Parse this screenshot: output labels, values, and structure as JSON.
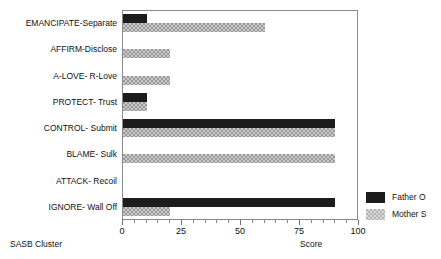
{
  "chart_data": {
    "type": "bar",
    "orientation": "horizontal",
    "title": "",
    "xlabel": "Score",
    "ylabel": "SASB Cluster",
    "xlim": [
      0,
      100
    ],
    "grid": false,
    "legend_position": "right",
    "xticks": [
      0,
      25,
      50,
      75,
      100
    ],
    "xtick_labels": [
      "0",
      "25",
      "50",
      "75",
      "100"
    ],
    "categories": [
      "EMANCIPATE-Separate",
      "AFFIRM-Disclose",
      "A-LOVE- R-Love",
      "PROTECT- Trust",
      "CONTROL- Submit",
      "BLAME- Sulk",
      "ATTACK- Recoil",
      "IGNORE- Wall Off"
    ],
    "series": [
      {
        "name": "Father O",
        "color": "#1c1c1c",
        "pattern": "solid",
        "values": [
          10,
          0,
          0,
          10,
          90,
          0,
          0,
          90
        ]
      },
      {
        "name": "Mother S",
        "color": "#9a9a9a",
        "pattern": "checker",
        "values": [
          60,
          20,
          20,
          10,
          90,
          90,
          0,
          20
        ]
      }
    ]
  }
}
